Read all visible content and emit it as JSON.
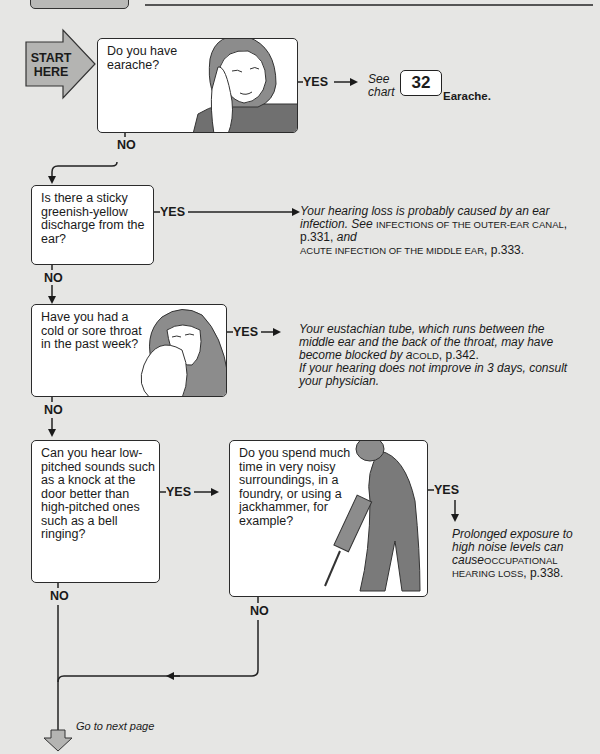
{
  "header": {
    "tab_label": "",
    "rule": true
  },
  "start": {
    "label_line1": "START",
    "label_line2": "HERE",
    "color": "#b4b4b2"
  },
  "questions": [
    {
      "id": "q1",
      "text": "Do you have earache?",
      "illustration": "woman-holding-ear",
      "yes": {
        "label": "YES",
        "see": "See",
        "chart": "chart",
        "chart_number": "32",
        "chart_title": "Earache."
      },
      "no": {
        "label": "NO"
      }
    },
    {
      "id": "q2",
      "text": "Is there a sticky greenish-yellow discharge from the ear?",
      "yes": {
        "label": "YES",
        "answer_part1": "Your hearing loss is probably caused by an ear infection. See ",
        "ref1": "INFECTIONS OF THE OUTER-EAR CANAL",
        "page1": ", p.331, ",
        "and": "and",
        "ref2": "ACUTE INFECTION OF THE MIDDLE EAR",
        "page2": ", p.333."
      },
      "no": {
        "label": "NO"
      }
    },
    {
      "id": "q3",
      "text": "Have you had a cold or sore throat in the past week?",
      "illustration": "woman-blowing-nose",
      "yes": {
        "label": "YES",
        "answer_part1": "Your eustachian tube, which runs between the middle ear and the back of the throat, may have become blocked by a",
        "ref1": "COLD",
        "page1": ", p.342.",
        "answer_part2": "If your hearing does not improve in 3 days, consult your physician."
      },
      "no": {
        "label": "NO"
      }
    },
    {
      "id": "q4",
      "text": "Can you hear low-pitched sounds such as a knock at the door better than high-pitched ones such as a bell ringing?",
      "yes": {
        "label": "YES"
      },
      "no": {
        "label": "NO"
      }
    },
    {
      "id": "q5",
      "text": "Do you spend much time in very noisy surroundings, in a foundry, or using a jackhammer, for example?",
      "illustration": "man-with-jackhammer",
      "yes": {
        "label": "YES",
        "answer_part1": "Prolonged exposure to high noise levels can cause",
        "ref1": "OCCUPATIONAL HEARING LOSS",
        "page1": ", p.338."
      },
      "no": {
        "label": "NO"
      }
    }
  ],
  "footer": {
    "next_label": "Go to next page",
    "arrow_color": "#b4b4b2"
  }
}
